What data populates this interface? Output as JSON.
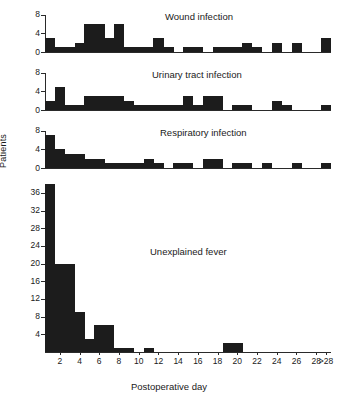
{
  "figure": {
    "ylabel": "Patients",
    "xlabel": "Postoperative day",
    "caption": ""
  },
  "chart_data": {
    "type": "bar",
    "xlabel": "Postoperative day",
    "ylabel": "Patients",
    "grid": false,
    "legend": "none",
    "categories": [
      "1",
      "2",
      "3",
      "4",
      "5",
      "6",
      "7",
      "8",
      "9",
      "10",
      "11",
      "12",
      "13",
      "14",
      "15",
      "16",
      "17",
      "18",
      "19",
      "20",
      "21",
      "22",
      "23",
      "24",
      "25",
      "26",
      "27",
      "28",
      ">28"
    ],
    "xlim": [
      1,
      29
    ],
    "xticks": [
      "2",
      "4",
      "6",
      "8",
      "10",
      "12",
      "14",
      "16",
      "18",
      "20",
      "22",
      "24",
      "26",
      "28",
      ">28"
    ],
    "panels": [
      {
        "name": "wound-infection",
        "title": "Wound infection",
        "ylim": [
          0,
          9
        ],
        "yticks": [
          0,
          4,
          8
        ],
        "values": [
          3,
          1,
          1,
          2,
          6,
          6,
          3,
          6,
          1,
          1,
          1,
          3,
          1,
          0,
          1,
          1,
          0,
          1,
          1,
          1,
          2,
          1,
          0,
          2,
          0,
          2,
          0,
          0,
          3
        ]
      },
      {
        "name": "urinary-tract-infection",
        "title": "Urinary tract infection",
        "ylim": [
          0,
          9
        ],
        "yticks": [
          0,
          4,
          8
        ],
        "values": [
          2,
          5,
          1,
          1,
          3,
          3,
          3,
          3,
          2,
          1,
          1,
          1,
          1,
          1,
          3,
          1,
          3,
          3,
          0,
          1,
          1,
          0,
          0,
          2,
          1,
          0,
          0,
          0,
          1
        ]
      },
      {
        "name": "respiratory-infection",
        "title": "Respiratory infection",
        "ylim": [
          0,
          9
        ],
        "yticks": [
          0,
          4,
          8
        ],
        "values": [
          7,
          4,
          3,
          3,
          2,
          2,
          1,
          1,
          1,
          1,
          2,
          1,
          0,
          1,
          1,
          0,
          2,
          2,
          0,
          1,
          1,
          0,
          1,
          0,
          0,
          1,
          0,
          0,
          1
        ]
      },
      {
        "name": "unexplained-fever",
        "title": "Unexplained fever",
        "ylim": [
          0,
          38
        ],
        "yticks": [
          4,
          8,
          12,
          16,
          20,
          24,
          28,
          32,
          36
        ],
        "values": [
          38,
          20,
          20,
          9,
          3,
          6,
          6,
          1,
          1,
          0,
          1,
          0,
          0,
          0,
          0,
          0,
          0,
          0,
          2,
          2,
          0,
          0,
          0,
          0,
          0,
          0,
          0,
          0,
          0
        ]
      }
    ]
  }
}
